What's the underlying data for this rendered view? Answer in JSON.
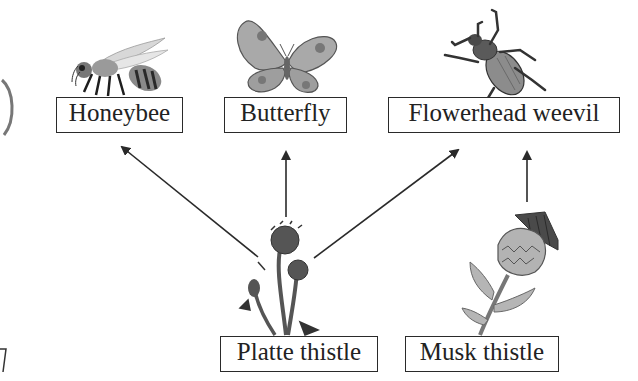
{
  "diagram": {
    "type": "food-web",
    "organisms": {
      "honeybee": {
        "label": "Honeybee",
        "icon": "honeybee-icon",
        "role": "consumer"
      },
      "butterfly": {
        "label": "Butterfly",
        "icon": "butterfly-icon",
        "role": "consumer"
      },
      "weevil": {
        "label": "Flowerhead weevil",
        "icon": "weevil-icon",
        "role": "consumer"
      },
      "platte": {
        "label": "Platte thistle",
        "icon": "platte-thistle-icon",
        "role": "producer"
      },
      "musk": {
        "label": "Musk thistle",
        "icon": "musk-thistle-icon",
        "role": "producer"
      }
    },
    "edges": [
      {
        "from": "Platte thistle",
        "to": "Honeybee"
      },
      {
        "from": "Platte thistle",
        "to": "Butterfly"
      },
      {
        "from": "Platte thistle",
        "to": "Flowerhead weevil"
      },
      {
        "from": "Musk thistle",
        "to": "Flowerhead weevil"
      }
    ],
    "colors": {
      "line": "#2a2a2a",
      "box_border": "#2a2a2a",
      "text": "#222222",
      "background": "#ffffff"
    }
  }
}
